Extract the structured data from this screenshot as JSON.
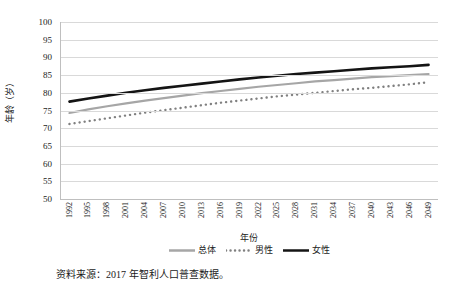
{
  "chart_data": {
    "type": "line",
    "title": "",
    "xlabel": "年份",
    "ylabel": "年龄（岁）",
    "ylim": [
      50,
      100
    ],
    "ytick_step": 5,
    "yticks": [
      100,
      95,
      90,
      85,
      80,
      75,
      70,
      65,
      60,
      55,
      50
    ],
    "grid": true,
    "legend_position": "bottom",
    "x": [
      1992,
      1995,
      1998,
      2001,
      2004,
      2007,
      2010,
      2013,
      2016,
      2019,
      2022,
      2025,
      2028,
      2031,
      2034,
      2037,
      2040,
      2043,
      2046,
      2049
    ],
    "xtick_labels": [
      "1992",
      "1995",
      "1998",
      "2001",
      "2004",
      "2007",
      "2010",
      "2013",
      "2016",
      "2019",
      "2022",
      "2025",
      "2028",
      "2031",
      "2034",
      "2037",
      "2040",
      "2043",
      "2046",
      "2049"
    ],
    "series": [
      {
        "name": "总体",
        "style": "solid",
        "color": "#a6a6a6",
        "width": 2.2,
        "values": [
          74.3,
          75.3,
          76.2,
          77.0,
          77.8,
          78.5,
          79.2,
          79.9,
          80.5,
          81.1,
          81.7,
          82.2,
          82.7,
          83.2,
          83.6,
          84.0,
          84.4,
          84.7,
          85.0,
          85.3
        ]
      },
      {
        "name": "男性",
        "style": "dotted",
        "color": "#808080",
        "width": 2.4,
        "values": [
          71.2,
          72.0,
          72.8,
          73.6,
          74.4,
          75.1,
          75.8,
          76.5,
          77.2,
          77.8,
          78.4,
          79.0,
          79.5,
          80.0,
          80.5,
          81.0,
          81.4,
          81.9,
          82.4,
          83.0
        ]
      },
      {
        "name": "女性",
        "style": "solid",
        "color": "#141414",
        "width": 2.6,
        "values": [
          77.5,
          78.4,
          79.2,
          80.0,
          80.7,
          81.4,
          82.0,
          82.6,
          83.2,
          83.8,
          84.3,
          84.8,
          85.3,
          85.7,
          86.1,
          86.5,
          86.9,
          87.2,
          87.5,
          87.9
        ]
      }
    ]
  },
  "axes": {
    "y_title": "年龄（岁）",
    "x_title": "年份"
  },
  "legend": {
    "items": [
      {
        "label": "总体",
        "style": "solid",
        "color": "#a6a6a6"
      },
      {
        "label": "男性",
        "style": "dotted",
        "color": "#808080"
      },
      {
        "label": "女性",
        "style": "solid",
        "color": "#141414"
      }
    ]
  },
  "source": {
    "note": "资料来源：2017 年智利人口普查数据。"
  }
}
